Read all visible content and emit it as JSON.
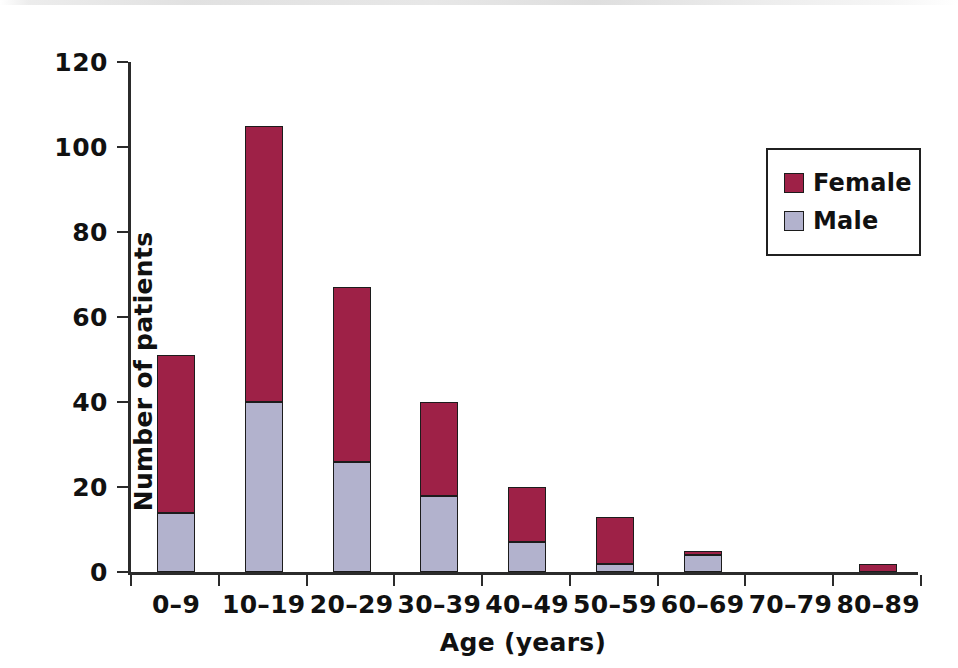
{
  "chart_data": {
    "type": "bar",
    "subtype": "stacked-vertical",
    "title": "",
    "xlabel": "Age (years)",
    "ylabel": "Number of patients",
    "categories": [
      "0–9",
      "10–19",
      "20–29",
      "30–39",
      "40–49",
      "50–59",
      "60–69",
      "70–79",
      "80–89"
    ],
    "series": [
      {
        "name": "Male",
        "values": [
          14,
          40,
          26,
          18,
          7,
          2,
          4,
          0,
          0
        ],
        "color": "#b2b2cd"
      },
      {
        "name": "Female",
        "values": [
          37,
          65,
          41,
          22,
          13,
          11,
          1,
          0,
          2
        ],
        "color": "#9e2147"
      }
    ],
    "stack_order": [
      "Male",
      "Female"
    ],
    "totals": [
      51,
      105,
      67,
      40,
      20,
      13,
      5,
      0,
      2
    ],
    "ylim": [
      0,
      120
    ],
    "yticks": [
      0,
      20,
      40,
      60,
      80,
      100,
      120
    ],
    "ytick_labels": [
      "0",
      "20",
      "40",
      "60",
      "80",
      "100",
      "120"
    ],
    "grid": false,
    "legend_position": "top-right",
    "legend_entries": [
      "Female",
      "Male"
    ]
  },
  "legend": {
    "items": [
      {
        "label": "Female",
        "color": "#9e2147"
      },
      {
        "label": "Male",
        "color": "#b2b2cd"
      }
    ]
  },
  "axes": {
    "x_title": "Age (years)",
    "y_title": "Number of patients"
  }
}
